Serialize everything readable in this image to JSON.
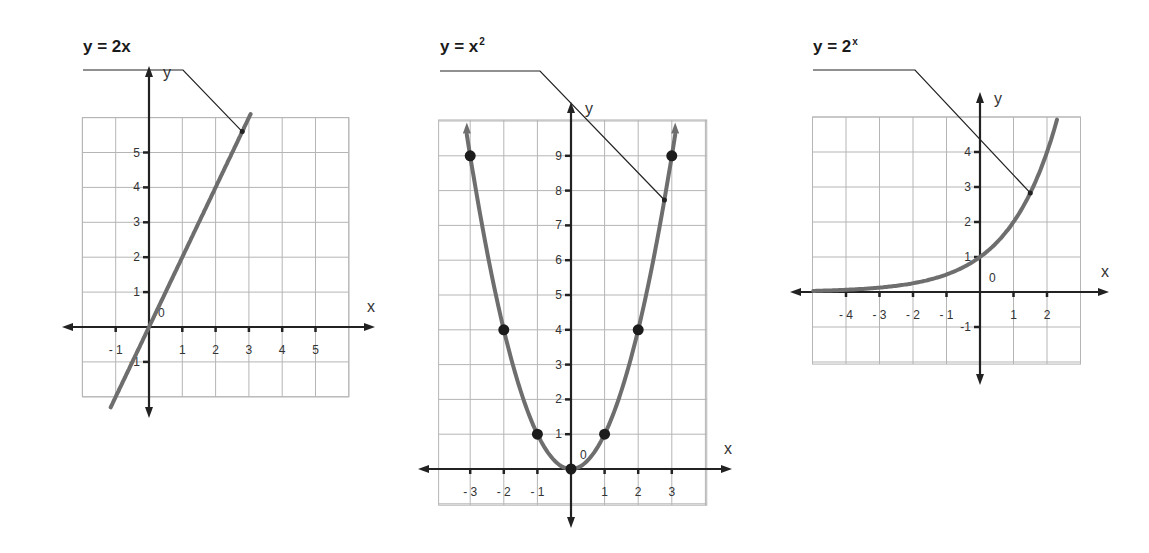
{
  "colors": {
    "background": "#ffffff",
    "grid": "#b5b5b5",
    "axis": "#222222",
    "curve": "#6e6e6e",
    "point": "#1c1c1c",
    "leader": "#222222",
    "text": "#333333"
  },
  "chart_data": [
    {
      "type": "line",
      "id": "linear",
      "title": "y = 2x",
      "title_base": "y = 2x",
      "title_sup": "",
      "function": "2x",
      "xlabel": "x",
      "ylabel": "y",
      "origin_label": "0",
      "grid": true,
      "xlim": [
        -2,
        6
      ],
      "ylim": [
        -2,
        6
      ],
      "x_ticks": [
        -1,
        1,
        2,
        3,
        4,
        5
      ],
      "y_ticks": [
        -1,
        1,
        2,
        3,
        4,
        5
      ],
      "x_tick_labels": [
        "- 1",
        "1",
        "2",
        "3",
        "4",
        "5"
      ],
      "y_tick_labels": [
        "-1",
        "1",
        "2",
        "3",
        "4",
        "5"
      ],
      "curve_domain": [
        -1.15,
        3.05
      ],
      "points": [],
      "leader_point": [
        2.8,
        5.6
      ],
      "layout": {
        "ox": 149,
        "oy": 327,
        "ux": 33.3,
        "uy": 34.9,
        "grid_x": [
          -2,
          6
        ],
        "grid_y": [
          -2,
          6
        ],
        "axis_x": [
          62,
          375
        ],
        "axis_y": [
          418,
          66
        ],
        "title_pos": [
          83,
          38
        ],
        "leader_start": [
          83,
          70
        ],
        "leader_knee": [
          183,
          70
        ]
      }
    },
    {
      "type": "line",
      "id": "quadratic",
      "title": "y = x²",
      "title_base": "y = x",
      "title_sup": "2",
      "function": "x^2",
      "xlabel": "x",
      "ylabel": "y",
      "origin_label": "0",
      "grid": true,
      "xlim": [
        -4,
        4
      ],
      "ylim": [
        -1,
        10
      ],
      "x_ticks": [
        -3,
        -2,
        -1,
        1,
        2,
        3
      ],
      "y_ticks": [
        1,
        2,
        3,
        4,
        5,
        6,
        7,
        8,
        9
      ],
      "x_tick_labels": [
        "- 3",
        "- 2",
        "- 1",
        "1",
        "2",
        "3"
      ],
      "y_tick_labels": [
        "1",
        "2",
        "3",
        "4",
        "5",
        "6",
        "7",
        "8",
        "9"
      ],
      "curve_domain": [
        -3.1,
        3.1
      ],
      "points": [
        [
          -3,
          9
        ],
        [
          -2,
          4
        ],
        [
          -1,
          1
        ],
        [
          0,
          0
        ],
        [
          1,
          1
        ],
        [
          2,
          4
        ],
        [
          3,
          9
        ]
      ],
      "leader_point": [
        2.78,
        7.73
      ],
      "layout": {
        "ox": 571,
        "oy": 469,
        "ux": 33.6,
        "uy": 34.8,
        "grid_x": [
          -3.94,
          4.04
        ],
        "grid_y": [
          -1.04,
          10.03
        ],
        "axis_x": [
          418,
          732
        ],
        "axis_y": [
          528,
          102
        ],
        "title_pos": [
          440,
          38
        ],
        "leader_start": [
          440,
          71
        ],
        "leader_knee": [
          540,
          71
        ]
      }
    },
    {
      "type": "line",
      "id": "exponential",
      "title": "y = 2ˣ",
      "title_base": "y = 2",
      "title_sup": "x",
      "function": "2^x",
      "xlabel": "x",
      "ylabel": "y",
      "origin_label": "0",
      "grid": true,
      "xlim": [
        -5,
        3
      ],
      "ylim": [
        -2,
        5
      ],
      "x_ticks": [
        -4,
        -3,
        -2,
        -1,
        1,
        2
      ],
      "y_ticks": [
        -1,
        1,
        2,
        3,
        4
      ],
      "x_tick_labels": [
        "- 4",
        "- 3",
        "- 2",
        "- 1",
        "1",
        "2"
      ],
      "y_tick_labels": [
        "-1",
        "1",
        "2",
        "3",
        "4"
      ],
      "curve_domain": [
        -4.98,
        2.3
      ],
      "points": [],
      "leader_point": [
        1.5,
        2.83
      ],
      "layout": {
        "ox": 980,
        "oy": 292,
        "ux": 33.5,
        "uy": 35.0,
        "grid_x": [
          -5,
          3
        ],
        "grid_y": [
          -2.06,
          5.0
        ],
        "axis_x": [
          790,
          1109
        ],
        "axis_y": [
          385,
          92
        ],
        "title_pos": [
          813,
          38
        ],
        "leader_start": [
          813,
          70
        ],
        "leader_knee": [
          915,
          70
        ]
      }
    }
  ]
}
